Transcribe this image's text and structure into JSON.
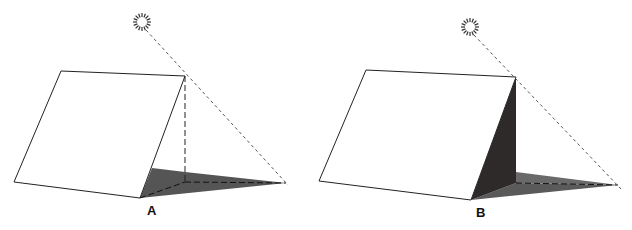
{
  "figure": {
    "panels": [
      {
        "label": "A",
        "description": "Tent-shaped prism lit by sun; shadow cast on ground plane, shaded region with dashed construction lines",
        "sun": {
          "cx": 142,
          "cy": 22
        },
        "colors": {
          "shadow": "#555555",
          "outline": "#222222"
        }
      },
      {
        "label": "B",
        "description": "Same prism; back face in shade (dark) plus ground shadow",
        "sun": {
          "cx": 470,
          "cy": 27
        },
        "colors": {
          "shade_face": "#2e2a2a",
          "shadow": "#5a5a5a",
          "outline": "#222222"
        }
      }
    ]
  }
}
